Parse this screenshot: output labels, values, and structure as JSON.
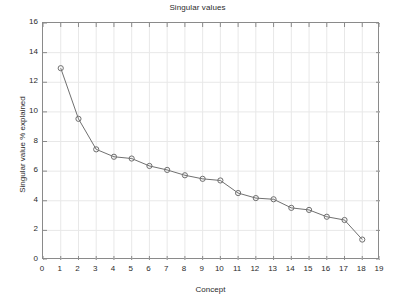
{
  "chart_data": {
    "type": "line",
    "title": "Singular values",
    "xlabel": "Concept",
    "ylabel": "Singular value % explained",
    "x": [
      1,
      2,
      3,
      4,
      5,
      6,
      7,
      8,
      9,
      10,
      11,
      12,
      13,
      14,
      15,
      16,
      17,
      18
    ],
    "values": [
      12.95,
      9.53,
      7.47,
      6.97,
      6.85,
      6.35,
      6.08,
      5.72,
      5.48,
      5.37,
      4.52,
      4.18,
      4.1,
      3.52,
      3.38,
      2.92,
      2.7,
      1.38
    ],
    "series": [
      {
        "name": "Singular value % explained",
        "values": [
          12.95,
          9.53,
          7.47,
          6.97,
          6.85,
          6.35,
          6.08,
          5.72,
          5.48,
          5.37,
          4.52,
          4.18,
          4.1,
          3.52,
          3.38,
          2.92,
          2.7,
          1.38
        ]
      }
    ],
    "xlim": [
      0,
      19
    ],
    "ylim": [
      0,
      16
    ],
    "xticks": [
      0,
      1,
      2,
      3,
      4,
      5,
      6,
      7,
      8,
      9,
      10,
      11,
      12,
      13,
      14,
      15,
      16,
      17,
      18,
      19
    ],
    "xtick_labels": [
      "0",
      "1",
      "2",
      "3",
      "4",
      "5",
      "6",
      "7",
      "8",
      "9",
      "10",
      "11",
      "12",
      "13",
      "14",
      "15",
      "16",
      "17",
      "18",
      "19"
    ],
    "yticks": [
      0,
      2,
      4,
      6,
      8,
      10,
      12,
      14,
      16
    ],
    "ytick_labels": [
      "0",
      "2",
      "4",
      "6",
      "8",
      "10",
      "12",
      "14",
      "16"
    ],
    "grid": true,
    "legend": null,
    "marker": "circle",
    "line_color": "#707070",
    "marker_color": "#6f6f6f",
    "grid_color": "#e8e8e8",
    "axis_color": "#8a8a8a",
    "background_color": "#ffffff"
  }
}
